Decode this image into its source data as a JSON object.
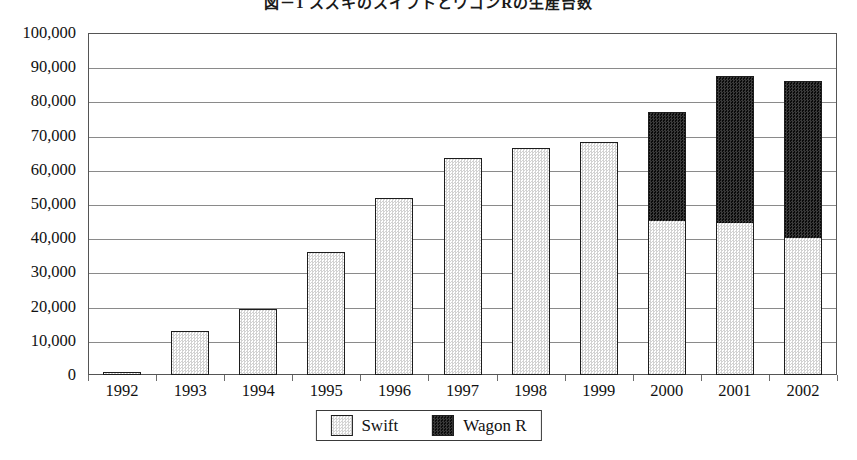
{
  "chart_data": {
    "type": "bar",
    "stacked": true,
    "title": "図－1 スズキのスイフトとワゴンRの生産台数",
    "xlabel": "",
    "ylabel": "",
    "ylim": [
      0,
      100000
    ],
    "ytick_step": 10000,
    "grid": true,
    "legend_position": "bottom",
    "categories": [
      "1992",
      "1993",
      "1994",
      "1995",
      "1996",
      "1997",
      "1998",
      "1999",
      "2000",
      "2001",
      "2002"
    ],
    "ytick_labels": [
      "100,000",
      "90,000",
      "80,000",
      "70,000",
      "60,000",
      "50,000",
      "40,000",
      "30,000",
      "20,000",
      "10,000",
      "0"
    ],
    "series": [
      {
        "name": "Swift",
        "color": "#efefef",
        "pattern": "light-dotted",
        "values": [
          1000,
          12800,
          19200,
          36000,
          51800,
          63500,
          66500,
          68000,
          45000,
          44500,
          40000
        ]
      },
      {
        "name": "Wagon R",
        "color": "#171717",
        "pattern": "dark-dotted",
        "values": [
          0,
          0,
          0,
          0,
          0,
          0,
          0,
          0,
          32000,
          43000,
          46000
        ]
      }
    ],
    "totals": [
      1000,
      12800,
      19200,
      36000,
      51800,
      63500,
      66500,
      68000,
      77000,
      87500,
      86000
    ]
  },
  "legend": {
    "items": [
      {
        "label": "Swift",
        "swatch": "swift-swatch-icon"
      },
      {
        "label": "Wagon R",
        "swatch": "wagon-r-swatch-icon"
      }
    ]
  }
}
